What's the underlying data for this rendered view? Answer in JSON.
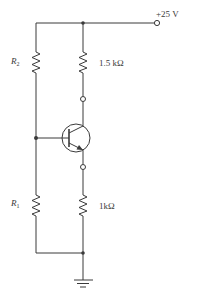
{
  "diagram": {
    "type": "circuit-schematic",
    "supply": {
      "label": "+25 V"
    },
    "components": [
      {
        "id": "R2",
        "type": "resistor",
        "label_main": "R",
        "label_sub": "2",
        "position": "upper-left"
      },
      {
        "id": "RC",
        "type": "resistor",
        "label": "1.5 kΩ",
        "position": "upper-right (collector)"
      },
      {
        "id": "Q1",
        "type": "npn-transistor",
        "position": "center"
      },
      {
        "id": "R1",
        "type": "resistor",
        "label_main": "R",
        "label_sub": "1",
        "position": "lower-left"
      },
      {
        "id": "RE",
        "type": "resistor",
        "label": "1kΩ",
        "position": "lower-right (emitter)"
      },
      {
        "id": "GND",
        "type": "ground",
        "position": "bottom"
      }
    ],
    "terminals": [
      "supply-terminal",
      "collector-terminal",
      "emitter-terminal"
    ],
    "colors": {
      "line": "#3a3a3a",
      "background": "#ffffff"
    }
  }
}
